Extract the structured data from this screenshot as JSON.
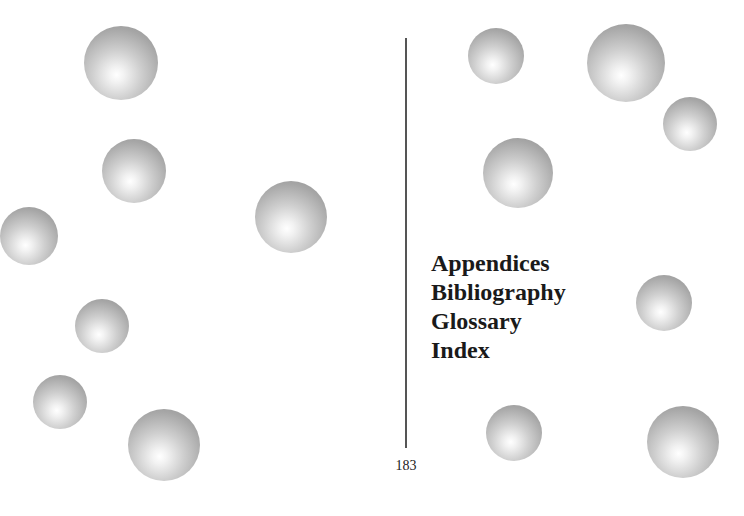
{
  "sections": [
    {
      "label": "Appendices"
    },
    {
      "label": "Bibliography"
    },
    {
      "label": "Glossary"
    },
    {
      "label": "Index"
    }
  ],
  "page_number": "183",
  "decoration": {
    "sphere_color": "#a6a6a6",
    "spheres": [
      {
        "cx": 121,
        "cy": 63,
        "r": 37
      },
      {
        "cx": 134,
        "cy": 171,
        "r": 32
      },
      {
        "cx": 29,
        "cy": 236,
        "r": 29
      },
      {
        "cx": 291,
        "cy": 217,
        "r": 36
      },
      {
        "cx": 102,
        "cy": 326,
        "r": 27
      },
      {
        "cx": 60,
        "cy": 402,
        "r": 27
      },
      {
        "cx": 164,
        "cy": 445,
        "r": 36
      },
      {
        "cx": 496,
        "cy": 56,
        "r": 28
      },
      {
        "cx": 626,
        "cy": 63,
        "r": 39
      },
      {
        "cx": 690,
        "cy": 124,
        "r": 27
      },
      {
        "cx": 518,
        "cy": 173,
        "r": 35
      },
      {
        "cx": 664,
        "cy": 303,
        "r": 28
      },
      {
        "cx": 514,
        "cy": 433,
        "r": 28
      },
      {
        "cx": 683,
        "cy": 442,
        "r": 36
      }
    ]
  }
}
